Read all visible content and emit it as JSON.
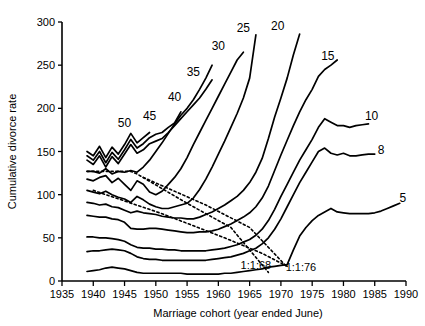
{
  "chart_data": {
    "type": "line",
    "title": "",
    "xlabel": "Marriage cohort (year ended June)",
    "ylabel": "Cumulative divorce rate",
    "xlim": [
      1935,
      1990
    ],
    "ylim": [
      0,
      300
    ],
    "xticks": [
      1935,
      1940,
      1945,
      1950,
      1955,
      1960,
      1965,
      1970,
      1975,
      1980,
      1985,
      1990
    ],
    "yticks": [
      0,
      50,
      100,
      150,
      200,
      250,
      300
    ],
    "grid": false,
    "legend_position": "inline-end-labels",
    "legend_entries": [
      "50",
      "45",
      "40",
      "35",
      "30",
      "25",
      "20",
      "15",
      "10",
      "8",
      "5"
    ],
    "annotations": [
      {
        "text": "1:1:68",
        "x": 1966.0,
        "y": 14
      },
      {
        "text": "1:1:76",
        "x": 1973.2,
        "y": 12
      }
    ],
    "series": [
      {
        "name": "50",
        "label": "50",
        "label_x": 1945.0,
        "label_y": 178,
        "x": [
          1939,
          1940,
          1941,
          1942,
          1943,
          1944,
          1945,
          1946,
          1947,
          1948,
          1949
        ],
        "values": [
          150,
          145,
          156,
          143,
          155,
          147,
          158,
          171,
          160,
          166,
          172
        ]
      },
      {
        "name": "45",
        "label": "45",
        "label_x": 1949.0,
        "label_y": 186,
        "x": [
          1939,
          1940,
          1941,
          1942,
          1943,
          1944,
          1945,
          1946,
          1947,
          1948,
          1949,
          1950,
          1951,
          1952,
          1953,
          1954
        ],
        "values": [
          145,
          140,
          150,
          137,
          149,
          141,
          152,
          164,
          154,
          159,
          166,
          170,
          172,
          178,
          183,
          196
        ]
      },
      {
        "name": "40",
        "label": "40",
        "label_x": 1953.0,
        "label_y": 208,
        "x": [
          1939,
          1940,
          1941,
          1942,
          1943,
          1944,
          1945,
          1946,
          1947,
          1948,
          1949,
          1950,
          1951,
          1952,
          1953,
          1954,
          1955,
          1956,
          1957,
          1958,
          1959
        ],
        "values": [
          140,
          135,
          145,
          132,
          144,
          136,
          147,
          158,
          148,
          152,
          159,
          162,
          165,
          172,
          180,
          188,
          196,
          204,
          212,
          222,
          233
        ]
      },
      {
        "name": "35",
        "label": "35",
        "label_x": 1956.0,
        "label_y": 238,
        "x": [
          1939,
          1940,
          1941,
          1942,
          1943,
          1944,
          1945,
          1946,
          1947,
          1948,
          1949,
          1950,
          1951,
          1952,
          1953,
          1954,
          1955,
          1956,
          1957,
          1958,
          1959
        ],
        "values": [
          127,
          127,
          125,
          130,
          124,
          127,
          126,
          128,
          126,
          132,
          140,
          150,
          160,
          171,
          182,
          192,
          200,
          210,
          222,
          235,
          250
        ]
      },
      {
        "name": "30",
        "label": "30",
        "label_x": 1960.0,
        "label_y": 268,
        "x": [
          1939,
          1940,
          1941,
          1942,
          1943,
          1944,
          1945,
          1946,
          1947,
          1948,
          1949,
          1950,
          1951,
          1952,
          1953,
          1954,
          1955,
          1956,
          1957,
          1958,
          1959,
          1960,
          1961,
          1962,
          1963,
          1964
        ],
        "values": [
          118,
          116,
          120,
          122,
          114,
          119,
          112,
          105,
          116,
          112,
          103,
          100,
          104,
          112,
          120,
          130,
          143,
          158,
          172,
          186,
          200,
          214,
          228,
          242,
          256,
          265
        ]
      },
      {
        "name": "25",
        "label": "25",
        "label_x": 1964.0,
        "label_y": 288,
        "x": [
          1939,
          1940,
          1941,
          1942,
          1943,
          1944,
          1945,
          1946,
          1947,
          1948,
          1949,
          1950,
          1951,
          1952,
          1953,
          1954,
          1955,
          1956,
          1957,
          1958,
          1959,
          1960,
          1961,
          1962,
          1963,
          1964,
          1965,
          1966
        ],
        "values": [
          105,
          103,
          101,
          104,
          100,
          97,
          95,
          91,
          98,
          94,
          89,
          86,
          84,
          84,
          86,
          88,
          90,
          96,
          106,
          118,
          132,
          147,
          162,
          178,
          194,
          212,
          235,
          285
        ]
      },
      {
        "name": "20",
        "label": "20",
        "label_x": 1969.5,
        "label_y": 291,
        "x": [
          1939,
          1940,
          1941,
          1942,
          1943,
          1944,
          1945,
          1946,
          1947,
          1948,
          1949,
          1950,
          1951,
          1952,
          1953,
          1954,
          1955,
          1956,
          1957,
          1958,
          1959,
          1960,
          1961,
          1962,
          1963,
          1964,
          1965,
          1966,
          1967,
          1968,
          1969,
          1970,
          1971,
          1972,
          1973
        ],
        "values": [
          91,
          90,
          88,
          89,
          86,
          85,
          82,
          79,
          81,
          79,
          78,
          77,
          75,
          74,
          73,
          73,
          72,
          72,
          74,
          77,
          80,
          84,
          88,
          93,
          98,
          105,
          114,
          126,
          142,
          165,
          190,
          212,
          235,
          262,
          286
        ]
      },
      {
        "name": "15",
        "label": "15",
        "label_x": 1977.5,
        "label_y": 256,
        "x": [
          1939,
          1940,
          1941,
          1942,
          1943,
          1944,
          1945,
          1946,
          1947,
          1948,
          1949,
          1950,
          1951,
          1952,
          1953,
          1954,
          1955,
          1956,
          1957,
          1958,
          1959,
          1960,
          1961,
          1962,
          1963,
          1964,
          1965,
          1966,
          1967,
          1968,
          1969,
          1970,
          1971,
          1972,
          1973,
          1974,
          1975,
          1976,
          1977,
          1978,
          1979
        ],
        "values": [
          76,
          75,
          74,
          74,
          72,
          71,
          68,
          61,
          60,
          60,
          61,
          61,
          60,
          59,
          58,
          57,
          56,
          56,
          57,
          57,
          58,
          60,
          63,
          66,
          70,
          74,
          79,
          86,
          96,
          110,
          128,
          146,
          163,
          180,
          196,
          210,
          222,
          237,
          245,
          250,
          256
        ]
      },
      {
        "name": "10",
        "label": "10",
        "label_x": 1984.5,
        "label_y": 186,
        "x": [
          1939,
          1940,
          1941,
          1942,
          1943,
          1944,
          1945,
          1946,
          1947,
          1948,
          1949,
          1950,
          1951,
          1952,
          1953,
          1954,
          1955,
          1956,
          1957,
          1958,
          1959,
          1960,
          1961,
          1962,
          1963,
          1964,
          1965,
          1966,
          1967,
          1968,
          1969,
          1970,
          1971,
          1972,
          1973,
          1974,
          1975,
          1976,
          1977,
          1978,
          1979,
          1980,
          1981,
          1982,
          1983,
          1984
        ],
        "values": [
          51,
          51,
          50,
          50,
          49,
          48,
          46,
          42,
          39,
          38,
          38,
          37,
          37,
          36,
          36,
          35,
          35,
          35,
          35,
          35,
          36,
          37,
          38,
          40,
          42,
          45,
          48,
          53,
          60,
          70,
          83,
          98,
          112,
          126,
          140,
          152,
          164,
          178,
          188,
          184,
          180,
          180,
          178,
          180,
          181,
          182
        ]
      },
      {
        "name": "8",
        "label": "8",
        "label_x": 1986.0,
        "label_y": 147,
        "x": [
          1939,
          1940,
          1941,
          1942,
          1943,
          1944,
          1945,
          1946,
          1947,
          1948,
          1949,
          1950,
          1951,
          1952,
          1953,
          1954,
          1955,
          1956,
          1957,
          1958,
          1959,
          1960,
          1961,
          1962,
          1963,
          1964,
          1965,
          1966,
          1967,
          1968,
          1969,
          1970,
          1971,
          1972,
          1973,
          1974,
          1975,
          1976,
          1977,
          1978,
          1979,
          1980,
          1981,
          1982,
          1983,
          1984,
          1985
        ],
        "values": [
          34,
          35,
          35,
          36,
          37,
          36,
          35,
          32,
          28,
          26,
          25,
          25,
          24,
          24,
          24,
          24,
          24,
          24,
          24,
          24,
          25,
          26,
          27,
          28,
          30,
          32,
          35,
          38,
          43,
          50,
          60,
          72,
          86,
          100,
          114,
          126,
          138,
          150,
          154,
          148,
          146,
          148,
          145,
          145,
          146,
          147,
          147
        ]
      },
      {
        "name": "5",
        "label": "5",
        "label_x": 1989.5,
        "label_y": 92,
        "x": [
          1939,
          1940,
          1941,
          1942,
          1943,
          1944,
          1945,
          1946,
          1947,
          1948,
          1949,
          1950,
          1951,
          1952,
          1953,
          1954,
          1955,
          1956,
          1957,
          1958,
          1959,
          1960,
          1961,
          1962,
          1963,
          1964,
          1965,
          1966,
          1967,
          1968,
          1969,
          1970,
          1971,
          1972,
          1973,
          1974,
          1975,
          1976,
          1977,
          1978,
          1979,
          1980,
          1981,
          1982,
          1983,
          1984,
          1985,
          1986,
          1987,
          1988,
          1989
        ],
        "values": [
          11,
          12,
          13,
          15,
          16,
          15,
          14,
          12,
          10,
          9,
          9,
          9,
          9,
          9,
          9,
          9,
          8,
          8,
          8,
          8,
          8,
          8,
          9,
          9,
          10,
          11,
          12,
          13,
          14,
          16,
          17,
          18,
          19,
          36,
          52,
          62,
          70,
          76,
          80,
          84,
          80,
          79,
          78,
          78,
          78,
          78,
          79,
          81,
          84,
          87,
          90
        ]
      }
    ],
    "reference_lines": [
      {
        "name": "cohort-1968-diagonal",
        "style": "dotted",
        "label": "1:1:68",
        "x": [
          1939,
          1946,
          1947,
          1955,
          1962,
          1968
        ],
        "values": [
          127,
          127,
          124,
          90,
          62,
          10
        ]
      },
      {
        "name": "cohort-1976-diagonal",
        "style": "dotted",
        "label": "1:1:76",
        "x": [
          1940,
          1951,
          1961,
          1967,
          1971
        ],
        "values": [
          105,
          78,
          50,
          32,
          17
        ]
      },
      {
        "name": "cohort-diagonal-upper",
        "style": "dotted",
        "x": [
          1948,
          1958,
          1965,
          1971
        ],
        "values": [
          120,
          88,
          62,
          16
        ]
      }
    ]
  }
}
